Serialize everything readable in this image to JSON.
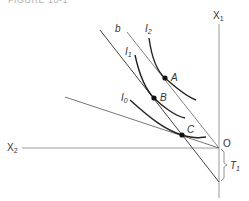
{
  "caption": "FIGURE 10-1",
  "axes": {
    "vertical": {
      "label": "X",
      "sub": "1"
    },
    "horizontal": {
      "label": "X",
      "sub": "2"
    },
    "origin": "O"
  },
  "lines": {
    "budget_b": "b"
  },
  "curves": {
    "I2": {
      "label": "I",
      "sub": "2"
    },
    "I1": {
      "label": "I",
      "sub": "1"
    },
    "I0": {
      "label": "I",
      "sub": "0"
    }
  },
  "points": {
    "A": "A",
    "B": "B",
    "C": "C"
  },
  "bracket": {
    "label": "T",
    "sub": "1"
  },
  "colors": {
    "axis": "#999999",
    "curve": "#222222",
    "line": "#555555"
  }
}
